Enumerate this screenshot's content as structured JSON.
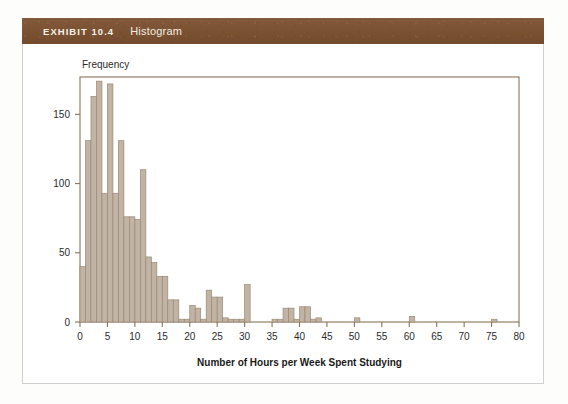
{
  "exhibit": {
    "number_label": "EXHIBIT 10.4",
    "title": "Histogram",
    "band_color": "#7c5533",
    "frame_color": "#d2d0cc"
  },
  "chart_data": {
    "type": "bar",
    "title": "Histogram",
    "xlabel": "Number of Hours per Week Spent Studying",
    "ylabel": "Frequency",
    "y_caption": "Frequency",
    "xlim": [
      0,
      80
    ],
    "ylim": [
      0,
      177
    ],
    "grid": false,
    "legend": null,
    "bin_width": 1,
    "bar_fill": "#c2b4a4",
    "bar_stroke": "#9a8874",
    "axis_color": "#8a7358",
    "xticks": [
      0,
      5,
      10,
      15,
      20,
      25,
      30,
      35,
      40,
      45,
      50,
      55,
      60,
      65,
      70,
      75,
      80
    ],
    "xtick_labels": [
      "0",
      "5",
      "10",
      "15",
      "20",
      "25",
      "30",
      "35",
      "40",
      "45",
      "50",
      "55",
      "60",
      "65",
      "70",
      "75",
      "80"
    ],
    "yticks": [
      0,
      50,
      100,
      150
    ],
    "ytick_labels": [
      "0",
      "50",
      "100",
      "150"
    ],
    "categories": [
      0,
      1,
      2,
      3,
      4,
      5,
      6,
      7,
      8,
      9,
      10,
      11,
      12,
      13,
      14,
      15,
      16,
      17,
      18,
      19,
      20,
      21,
      22,
      23,
      24,
      25,
      26,
      27,
      28,
      29,
      30,
      31,
      32,
      33,
      34,
      35,
      36,
      37,
      38,
      39,
      40,
      41,
      42,
      43,
      44,
      45,
      46,
      47,
      48,
      49,
      50,
      51,
      52,
      53,
      54,
      55,
      56,
      57,
      58,
      59,
      60,
      61,
      62,
      63,
      64,
      65,
      66,
      67,
      68,
      69,
      70,
      71,
      72,
      73,
      74,
      75,
      76,
      77,
      78,
      79
    ],
    "values": [
      40,
      131,
      163,
      174,
      93,
      172,
      93,
      131,
      76,
      76,
      74,
      110,
      47,
      43,
      33,
      33,
      16,
      16,
      2,
      2,
      12,
      10,
      2,
      23,
      18,
      18,
      3,
      2,
      2,
      2,
      27,
      0,
      0,
      0,
      0,
      2,
      2,
      10,
      10,
      2,
      11,
      11,
      2,
      3,
      0,
      0,
      0,
      0,
      0,
      0,
      3,
      0,
      0,
      0,
      0,
      0,
      0,
      0,
      0,
      0,
      4,
      0,
      0,
      0,
      0,
      0,
      0,
      0,
      0,
      0,
      0,
      0,
      0,
      0,
      0,
      2,
      0,
      0,
      0,
      0
    ]
  }
}
